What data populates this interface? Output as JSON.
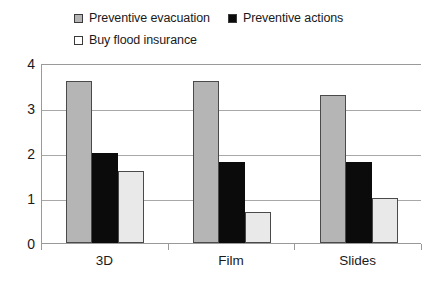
{
  "chart_data": {
    "type": "bar",
    "title": "",
    "xlabel": "",
    "ylabel": "",
    "categories": [
      "3D",
      "Film",
      "Slides"
    ],
    "series": [
      {
        "name": "Preventive evacuation",
        "color": "#b5b5b5",
        "values": [
          3.6,
          3.6,
          3.3
        ]
      },
      {
        "name": "Preventive actions",
        "color": "#0b0b0b",
        "values": [
          2.0,
          1.8,
          1.8
        ]
      },
      {
        "name": "Buy flood insurance",
        "color": "#e9e9e9",
        "values": [
          1.6,
          0.7,
          1.0
        ]
      }
    ],
    "ylim": [
      0,
      4
    ],
    "yticks": [
      "0",
      "1",
      "2",
      "3",
      "4"
    ],
    "grid": true,
    "legend_position": "top"
  },
  "legend": {
    "rows": [
      [
        {
          "label": "Preventive evacuation",
          "swatch": "#b5b5b5"
        },
        {
          "label": "Preventive actions",
          "swatch": "#0b0b0b"
        }
      ],
      [
        {
          "label": "Buy flood insurance",
          "swatch": "#ffffff"
        }
      ]
    ]
  },
  "axis": {
    "frame_color": "#9a9a9a",
    "grid_color": "#a8a8a8"
  }
}
